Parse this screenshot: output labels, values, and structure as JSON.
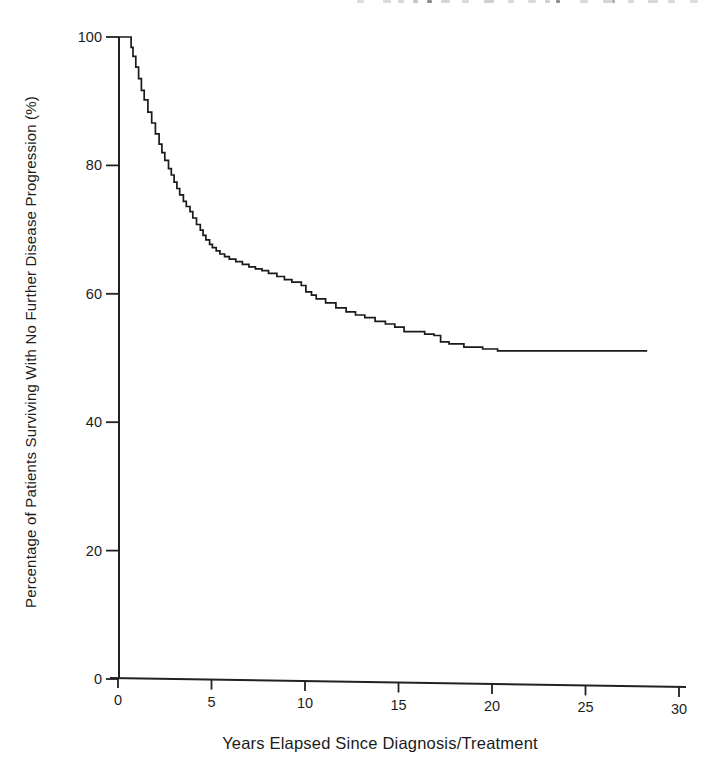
{
  "page": {
    "background_color": "#ffffff"
  },
  "top_remnants": {
    "description": "unreadable bottoms of letters from a line of text cropped off at the top edge",
    "marks": [
      [
        357,
        7,
        0.18
      ],
      [
        383,
        8,
        0.2
      ],
      [
        398,
        6,
        0.22
      ],
      [
        413,
        5,
        0.3
      ],
      [
        427,
        5,
        0.6
      ],
      [
        441,
        9,
        0.22
      ],
      [
        462,
        7,
        0.2
      ],
      [
        484,
        10,
        0.25
      ],
      [
        508,
        6,
        0.2
      ],
      [
        528,
        8,
        0.2
      ],
      [
        545,
        5,
        0.25
      ],
      [
        556,
        4,
        0.6
      ],
      [
        580,
        8,
        0.2
      ],
      [
        603,
        9,
        0.22
      ],
      [
        612,
        3,
        0.45
      ],
      [
        628,
        6,
        0.2
      ],
      [
        648,
        10,
        0.22
      ],
      [
        668,
        7,
        0.2
      ],
      [
        690,
        8,
        0.18
      ]
    ]
  },
  "chart_data": {
    "type": "line",
    "subtype": "kaplan-meier-step",
    "xlabel": "Years Elapsed Since Diagnosis/Treatment",
    "ylabel": "Percentage of Patients Surviving With No Further Disease Progression (%)",
    "xlim": [
      0,
      30
    ],
    "ylim": [
      0,
      100
    ],
    "x_ticks": [
      0,
      5,
      10,
      15,
      20,
      25,
      30
    ],
    "y_ticks": [
      0,
      20,
      40,
      60,
      80,
      100
    ],
    "grid": false,
    "legend": null,
    "line_color": "#1a1a1a",
    "axis_color": "#222222",
    "series": [
      {
        "name": "progression-free survival",
        "points": [
          [
            0,
            100
          ],
          [
            0.6,
            100
          ],
          [
            0.7,
            98.4
          ],
          [
            0.8,
            97.0
          ],
          [
            0.95,
            95.3
          ],
          [
            1.1,
            93.5
          ],
          [
            1.25,
            91.7
          ],
          [
            1.4,
            90.2
          ],
          [
            1.6,
            88.3
          ],
          [
            1.8,
            86.6
          ],
          [
            2.0,
            84.9
          ],
          [
            2.2,
            83.3
          ],
          [
            2.35,
            82.0
          ],
          [
            2.5,
            80.8
          ],
          [
            2.7,
            79.5
          ],
          [
            2.85,
            78.5
          ],
          [
            3.0,
            77.4
          ],
          [
            3.15,
            76.4
          ],
          [
            3.3,
            75.4
          ],
          [
            3.5,
            74.4
          ],
          [
            3.65,
            73.6
          ],
          [
            3.85,
            72.8
          ],
          [
            4.0,
            71.8
          ],
          [
            4.2,
            70.8
          ],
          [
            4.4,
            69.9
          ],
          [
            4.55,
            69.1
          ],
          [
            4.7,
            68.4
          ],
          [
            4.9,
            67.7
          ],
          [
            5.05,
            67.2
          ],
          [
            5.25,
            66.7
          ],
          [
            5.45,
            66.2
          ],
          [
            5.7,
            65.8
          ],
          [
            5.95,
            65.4
          ],
          [
            6.3,
            65.0
          ],
          [
            6.65,
            64.6
          ],
          [
            7.0,
            64.2
          ],
          [
            7.35,
            63.9
          ],
          [
            7.7,
            63.6
          ],
          [
            8.05,
            63.2
          ],
          [
            8.5,
            62.7
          ],
          [
            8.9,
            62.2
          ],
          [
            9.3,
            61.8
          ],
          [
            9.8,
            61.3
          ],
          [
            10.05,
            60.3
          ],
          [
            10.35,
            59.8
          ],
          [
            10.6,
            59.2
          ],
          [
            11.1,
            58.6
          ],
          [
            11.65,
            57.8
          ],
          [
            12.2,
            57.2
          ],
          [
            12.7,
            56.7
          ],
          [
            13.2,
            56.3
          ],
          [
            13.75,
            55.7
          ],
          [
            14.3,
            55.3
          ],
          [
            14.8,
            54.8
          ],
          [
            15.3,
            54.1
          ],
          [
            16.4,
            53.7
          ],
          [
            16.9,
            53.5
          ],
          [
            17.25,
            52.5
          ],
          [
            17.7,
            52.2
          ],
          [
            18.5,
            51.7
          ],
          [
            19.5,
            51.4
          ],
          [
            20.3,
            51.1
          ],
          [
            28.3,
            51.1
          ]
        ]
      }
    ]
  }
}
